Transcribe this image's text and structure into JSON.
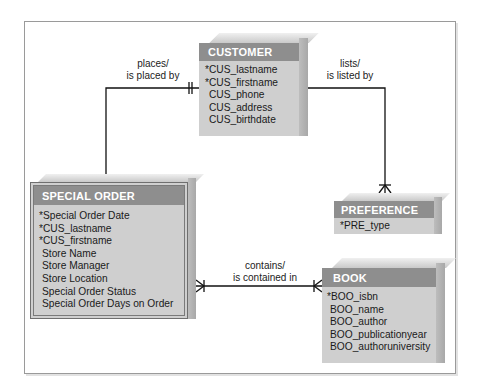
{
  "diagram": {
    "type": "ER diagram (Crow's Foot notation)",
    "entities": {
      "customer": {
        "name": "CUSTOMER",
        "attributes": [
          "*CUS_lastname",
          "*CUS_firstname",
          "CUS_phone",
          "CUS_address",
          "CUS_birthdate"
        ]
      },
      "special_order": {
        "name": "SPECIAL ORDER",
        "attributes": [
          "*Special Order Date",
          "*CUS_lastname",
          "*CUS_firstname",
          "Store Name",
          "Store Manager",
          "Store Location",
          "Special Order Status",
          "Special Order Days on Order"
        ]
      },
      "preference": {
        "name": "PREFERENCE",
        "attributes": [
          "*PRE_type"
        ]
      },
      "book": {
        "name": "BOOK",
        "attributes": [
          "*BOO_isbn",
          "BOO_name",
          "BOO_author",
          "BOO_publicationyear",
          "BOO_authoruniversity"
        ]
      }
    },
    "relationships": [
      {
        "label_line1": "places/",
        "label_line2": "is placed by",
        "from": "CUSTOMER",
        "to": "SPECIAL ORDER",
        "from_card": "one (mandatory)",
        "to_card": "many (mandatory)"
      },
      {
        "label_line1": "lists/",
        "label_line2": "is listed by",
        "from": "CUSTOMER",
        "to": "PREFERENCE",
        "from_card": "many (mandatory)",
        "to_card": "many (mandatory)"
      },
      {
        "label_line1": "contains/",
        "label_line2": "is contained in",
        "from": "SPECIAL ORDER",
        "to": "BOOK",
        "from_card": "many (mandatory)",
        "to_card": "many (mandatory)"
      }
    ],
    "colors": {
      "header": "#8e8e8e",
      "body": "#cfcfcf",
      "line": "#111111",
      "frame": "#9a9a9a"
    }
  }
}
